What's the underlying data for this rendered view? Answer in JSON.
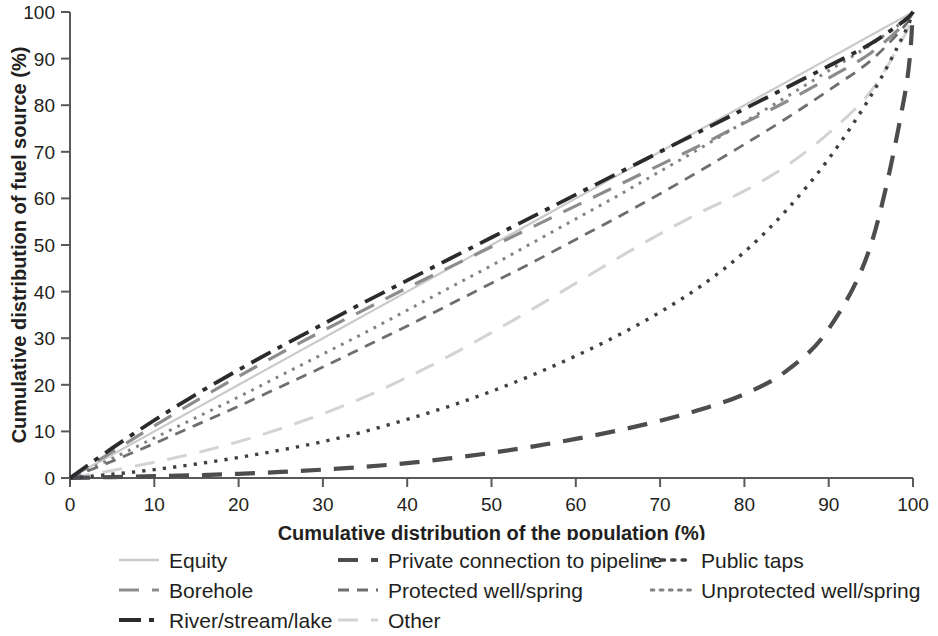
{
  "chart_data": {
    "type": "line",
    "title": "",
    "xlabel": "Cumulative distribution of the population (%)",
    "ylabel": "Cumulative distribution of fuel source (%)",
    "xlim": [
      0,
      100
    ],
    "ylim": [
      0,
      100
    ],
    "xticks": [
      "0",
      "10",
      "20",
      "30",
      "40",
      "50",
      "60",
      "70",
      "80",
      "90",
      "100"
    ],
    "yticks": [
      "0",
      "10",
      "20",
      "30",
      "40",
      "50",
      "60",
      "70",
      "80",
      "90",
      "100"
    ],
    "grid": false,
    "legend_position": "bottom",
    "x": [
      0,
      5,
      10,
      15,
      20,
      25,
      30,
      35,
      40,
      45,
      50,
      55,
      60,
      65,
      70,
      75,
      80,
      85,
      90,
      95,
      99,
      100
    ],
    "series": [
      {
        "name": "Equity",
        "color": "#c9cacc",
        "dash": "solid",
        "width": 2.2,
        "values": [
          0,
          5,
          10,
          15,
          20,
          25,
          30,
          35,
          40,
          45,
          50,
          55,
          60,
          65,
          70,
          75,
          80,
          85,
          90,
          95,
          99,
          100
        ]
      },
      {
        "name": "Private connection to pipeline",
        "color": "#4d4d4f",
        "dash": "long-dash",
        "width": 4.2,
        "values": [
          0,
          0.2,
          0.4,
          0.6,
          0.9,
          1.3,
          1.8,
          2.4,
          3.2,
          4.2,
          5.4,
          6.8,
          8.4,
          10.2,
          12.3,
          14.8,
          18.0,
          23.0,
          32.0,
          50.0,
          82.0,
          100
        ]
      },
      {
        "name": "Public taps",
        "color": "#3f3f41",
        "dash": "dotted",
        "width": 3.4,
        "values": [
          0,
          0.8,
          1.8,
          3.0,
          4.4,
          6.0,
          7.8,
          10.0,
          12.6,
          15.4,
          18.6,
          22.2,
          26.2,
          30.6,
          35.6,
          41.4,
          48.5,
          57.5,
          68.5,
          82.0,
          95.5,
          100
        ]
      },
      {
        "name": "Borehole",
        "color": "#8a8c8e",
        "dash": "long-dash",
        "width": 3.2,
        "values": [
          0,
          5.6,
          11.2,
          16.6,
          21.8,
          26.8,
          31.6,
          36.2,
          40.8,
          45.2,
          49.6,
          54.0,
          58.4,
          62.8,
          67.2,
          71.6,
          76.2,
          80.8,
          85.8,
          91.2,
          97.5,
          100
        ]
      },
      {
        "name": "Protected well/spring",
        "color": "#6d6e70",
        "dash": "short-dash",
        "width": 2.8,
        "values": [
          0,
          3.6,
          7.4,
          11.4,
          15.4,
          19.6,
          23.8,
          28.2,
          32.6,
          37.2,
          41.8,
          46.4,
          51.2,
          56.0,
          61.0,
          66.2,
          71.6,
          77.2,
          83.2,
          89.6,
          97.0,
          100
        ]
      },
      {
        "name": "Unprotected well/spring",
        "color": "#808285",
        "dash": "dotted",
        "width": 3.0,
        "values": [
          0,
          4.2,
          8.6,
          13.0,
          17.4,
          22.0,
          26.6,
          31.2,
          36.0,
          40.8,
          45.6,
          50.6,
          55.6,
          60.6,
          65.8,
          71.0,
          76.4,
          81.8,
          87.4,
          93.0,
          98.2,
          100
        ]
      },
      {
        "name": "River/stream/lake",
        "color": "#2b2b2d",
        "dash": "dash-dot",
        "width": 3.8,
        "values": [
          0,
          6.4,
          12.4,
          18.0,
          23.2,
          28.2,
          33.0,
          37.8,
          42.4,
          47.0,
          51.6,
          56.2,
          60.8,
          65.4,
          70.0,
          74.6,
          79.2,
          83.8,
          88.4,
          93.2,
          98.2,
          100
        ]
      },
      {
        "name": "Other",
        "color": "#d2d3d5",
        "dash": "long-dash",
        "width": 3.0,
        "values": [
          0,
          1.6,
          3.4,
          5.4,
          7.8,
          10.6,
          13.8,
          17.4,
          21.6,
          26.2,
          31.2,
          36.4,
          41.8,
          47.2,
          52.4,
          57.2,
          61.6,
          67.0,
          74.0,
          83.0,
          95.0,
          100
        ]
      }
    ]
  },
  "legend": {
    "columns": [
      [
        {
          "label": "Equity",
          "series": "Equity"
        },
        {
          "label": "Borehole",
          "series": "Borehole"
        },
        {
          "label": "River/stream/lake",
          "series": "River/stream/lake"
        }
      ],
      [
        {
          "label": "Private connection to pipeline",
          "series": "Private connection to pipeline"
        },
        {
          "label": "Protected well/spring",
          "series": "Protected well/spring"
        },
        {
          "label": "Other",
          "series": "Other"
        }
      ],
      [
        {
          "label": "Public taps",
          "series": "Public taps"
        },
        {
          "label": "Unprotected well/spring",
          "series": "Unprotected well/spring"
        }
      ]
    ]
  },
  "axes": {
    "x_title": "Cumulative distribution of the population (%)",
    "y_title": "Cumulative distribution of fuel source (%)"
  }
}
